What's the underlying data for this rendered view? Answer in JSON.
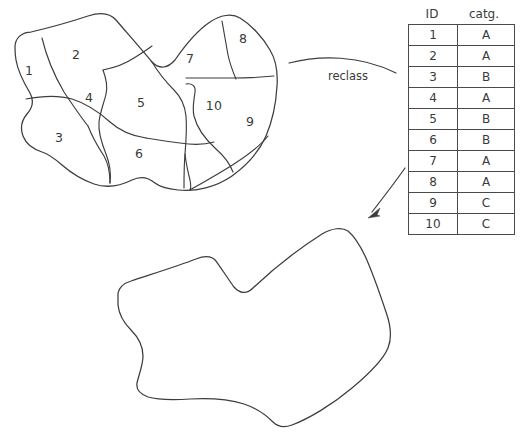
{
  "diagram": {
    "title": "reclass",
    "process_label": "reclass",
    "stroke_color": "#3d3d3d",
    "background_color": "#ffffff",
    "text_color": "#3a3a3a"
  },
  "source_map": {
    "name": "subdivided-polygon-map",
    "regions": [
      {
        "id": "1",
        "label": "1",
        "x": 29,
        "y": 70
      },
      {
        "id": "2",
        "label": "2",
        "x": 76,
        "y": 54
      },
      {
        "id": "3",
        "label": "3",
        "x": 59,
        "y": 137
      },
      {
        "id": "4",
        "label": "4",
        "x": 89,
        "y": 97
      },
      {
        "id": "5",
        "label": "5",
        "x": 141,
        "y": 102
      },
      {
        "id": "6",
        "label": "6",
        "x": 139,
        "y": 153
      },
      {
        "id": "7",
        "label": "7",
        "x": 190,
        "y": 58
      },
      {
        "id": "8",
        "label": "8",
        "x": 243,
        "y": 38
      },
      {
        "id": "9",
        "label": "9",
        "x": 250,
        "y": 121
      },
      {
        "id": "10",
        "label": "10",
        "x": 214,
        "y": 105
      }
    ]
  },
  "lookup_table": {
    "name": "id-category-table",
    "headers": {
      "id": "ID",
      "category": "catg."
    },
    "rows": [
      {
        "id": "1",
        "category": "A"
      },
      {
        "id": "2",
        "category": "A"
      },
      {
        "id": "3",
        "category": "B"
      },
      {
        "id": "4",
        "category": "A"
      },
      {
        "id": "5",
        "category": "B"
      },
      {
        "id": "6",
        "category": "B"
      },
      {
        "id": "7",
        "category": "A"
      },
      {
        "id": "8",
        "category": "A"
      },
      {
        "id": "9",
        "category": "C"
      },
      {
        "id": "10",
        "category": "C"
      }
    ]
  },
  "result_map": {
    "name": "merged-polygon-map",
    "regions": []
  }
}
